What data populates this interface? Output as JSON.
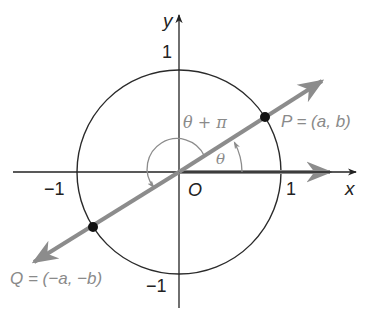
{
  "diagram": {
    "type": "unit-circle",
    "colors": {
      "axes": "#222222",
      "circle": "#2a2a2a",
      "line": "#8c8c8c",
      "points": "#111111",
      "gray_text": "#8a8a8a",
      "dark_text": "#222222"
    },
    "axes": {
      "x_label": "x",
      "y_label": "y",
      "origin_label": "O"
    },
    "ticks": {
      "x_pos": "1",
      "x_neg": "−1",
      "y_pos": "1",
      "y_neg": "−1"
    },
    "angles": {
      "theta_label": "θ",
      "theta_plus_pi_label": "θ + π",
      "theta_degrees_approx": 32.6
    },
    "points": {
      "P": {
        "label": "P = (a, b)",
        "position": "first quadrant on unit circle"
      },
      "Q": {
        "label": "Q = (−a, −b)",
        "position": "third quadrant on unit circle"
      }
    }
  }
}
